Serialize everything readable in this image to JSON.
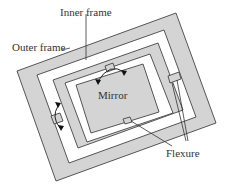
{
  "colors": {
    "fill": "#d4d4d4",
    "stroke": "#444444",
    "background": "#ffffff",
    "text": "#333333",
    "leader": "#333333"
  },
  "labels": {
    "inner_frame": {
      "text": "Inner frame",
      "x": 60,
      "y": 7
    },
    "outer_frame": {
      "text": "Outer frame",
      "x": 12,
      "y": 42
    },
    "mirror": {
      "text": "Mirror",
      "x": 98,
      "y": 90
    },
    "flexure": {
      "text": "Flexure",
      "x": 166,
      "y": 148
    }
  },
  "shapes": {
    "outer_frame_outer": [
      [
        17,
        71
      ],
      [
        176,
        13
      ],
      [
        216,
        123
      ],
      [
        56,
        181
      ]
    ],
    "outer_frame_inner": [
      [
        37,
        75
      ],
      [
        164,
        30
      ],
      [
        196,
        117
      ],
      [
        69,
        163
      ]
    ],
    "inner_frame_outer": [
      [
        53,
        80
      ],
      [
        158,
        43
      ],
      [
        183,
        110
      ],
      [
        78,
        148
      ]
    ],
    "inner_frame_inner": [
      [
        65,
        83
      ],
      [
        150,
        54
      ],
      [
        173,
        113
      ],
      [
        87,
        142
      ]
    ],
    "mirror": [
      [
        76,
        85
      ],
      [
        143,
        64
      ],
      [
        159,
        112
      ],
      [
        91,
        133
      ]
    ]
  },
  "flexures": {
    "outer_left": [
      [
        51,
        116
      ],
      [
        60,
        113
      ],
      [
        63,
        121
      ],
      [
        54,
        124
      ]
    ],
    "outer_right": [
      [
        168,
        76
      ],
      [
        179,
        72
      ],
      [
        181,
        79
      ],
      [
        170,
        83
      ]
    ],
    "inner_top": [
      [
        105,
        66
      ],
      [
        113,
        63
      ],
      [
        115,
        69
      ],
      [
        107,
        72
      ]
    ],
    "inner_bottom": [
      [
        123,
        119
      ],
      [
        130,
        117
      ],
      [
        132,
        122
      ],
      [
        125,
        124
      ]
    ]
  },
  "leaders": {
    "inner_frame": [
      [
        86,
        14
      ],
      [
        86,
        60
      ]
    ],
    "outer_frame": [
      [
        62,
        50
      ],
      [
        70,
        48
      ]
    ],
    "flexure_1": [
      [
        131,
        121
      ],
      [
        172,
        146
      ]
    ],
    "flexure_2": [
      [
        177,
        80
      ],
      [
        188,
        141
      ]
    ],
    "flexure_3": [
      [
        172,
        83
      ],
      [
        186,
        141
      ]
    ]
  },
  "rotation_arrows": {
    "inner_top": {
      "path": "M98,81 Q110,62 124,72",
      "heads": [
        [
          98,
          82
        ],
        [
          124,
          73
        ]
      ]
    },
    "outer_left": {
      "path": "M58,106 Q51,117 60,128",
      "heads": [
        [
          58,
          105
        ],
        [
          61,
          128
        ]
      ]
    }
  }
}
